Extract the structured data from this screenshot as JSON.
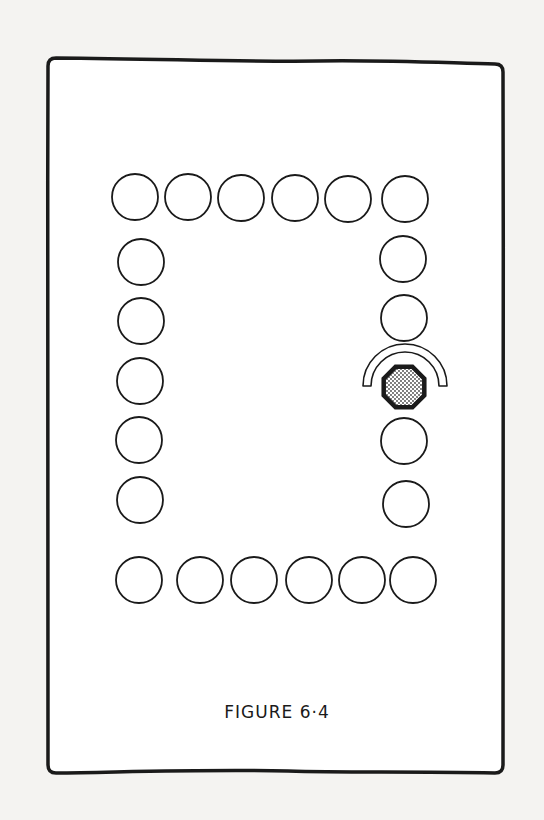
{
  "figure": {
    "caption": "FIGURE 6·4",
    "colors": {
      "background": "#f4f3f1",
      "paper": "#ffffff",
      "ink": "#1a1a1a",
      "stipple": "#9a9a9a"
    },
    "frame": {
      "x": 48,
      "y": 58,
      "width": 455,
      "height": 715,
      "radius": 8
    },
    "circle_radius": 23,
    "circles": {
      "top_row": [
        {
          "cx": 135,
          "cy": 197
        },
        {
          "cx": 188,
          "cy": 197
        },
        {
          "cx": 241,
          "cy": 198
        },
        {
          "cx": 295,
          "cy": 198
        },
        {
          "cx": 348,
          "cy": 199
        },
        {
          "cx": 405,
          "cy": 199
        }
      ],
      "left_column": [
        {
          "cx": 141,
          "cy": 262
        },
        {
          "cx": 141,
          "cy": 321
        },
        {
          "cx": 140,
          "cy": 381
        },
        {
          "cx": 139,
          "cy": 440
        },
        {
          "cx": 140,
          "cy": 500
        }
      ],
      "right_column": [
        {
          "cx": 403,
          "cy": 259
        },
        {
          "cx": 404,
          "cy": 318
        },
        {
          "cx": 404,
          "cy": 441
        },
        {
          "cx": 406,
          "cy": 504
        }
      ],
      "bottom_row": [
        {
          "cx": 139,
          "cy": 580
        },
        {
          "cx": 200,
          "cy": 580
        },
        {
          "cx": 254,
          "cy": 580
        },
        {
          "cx": 309,
          "cy": 580
        },
        {
          "cx": 362,
          "cy": 580
        },
        {
          "cx": 413,
          "cy": 580
        }
      ]
    },
    "marker": {
      "shape": "octagon",
      "fill": "stippled",
      "cx": 404,
      "cy": 387,
      "r": 22
    },
    "arc": {
      "cx": 405,
      "cy": 386,
      "outer_r": 42,
      "inner_r": 34
    }
  }
}
